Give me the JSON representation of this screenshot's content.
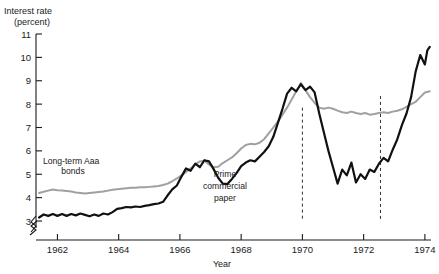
{
  "chart_data": {
    "type": "line",
    "title": "",
    "ylabel": "Interest rate (percent)",
    "ylabel_line1": "Interest rate",
    "ylabel_line2": "(percent)",
    "xlabel": "Year",
    "xlim": [
      1961.3,
      1974.2
    ],
    "ylim": [
      3,
      11
    ],
    "yticks": [
      3,
      4,
      5,
      6,
      7,
      8,
      9,
      10,
      11
    ],
    "ytick_labels": [
      "3",
      "4",
      "5",
      "6",
      "7",
      "8",
      "9",
      "10",
      "11"
    ],
    "xticks": [
      1962,
      1964,
      1966,
      1968,
      1970,
      1972,
      1974
    ],
    "xtick_labels": [
      "1962",
      "1964",
      "1966",
      "1968",
      "1970",
      "1972",
      "1974"
    ],
    "grid": false,
    "legend_position": "inline-annotations",
    "axis_break_y": true,
    "axis_break_x": true,
    "annotations": [
      {
        "name": "aaa-label",
        "text_line1": "Long-term Aaa",
        "text_line2": "bonds",
        "x": 1962.8,
        "y": 5.1
      },
      {
        "name": "prime-label",
        "text_line1": "Prime",
        "text_line2": "commercial",
        "text_line3": "paper",
        "x": 1967.5,
        "y": 4.9
      }
    ],
    "event_lines": [
      {
        "name": "event-line-1970",
        "x": 1970.0,
        "y_top": 7.85,
        "y_bottom": 3.0
      },
      {
        "name": "event-line-1972",
        "x": 1972.55,
        "y_top": 8.35,
        "y_bottom": 3.0
      }
    ],
    "series": [
      {
        "name": "Long-term Aaa bonds",
        "color": "#a0a0a0",
        "x": [
          1961.4,
          1961.55,
          1961.7,
          1961.85,
          1962.0,
          1962.15,
          1962.3,
          1962.45,
          1962.6,
          1962.75,
          1962.9,
          1963.05,
          1963.2,
          1963.35,
          1963.5,
          1963.65,
          1963.8,
          1963.95,
          1964.1,
          1964.25,
          1964.4,
          1964.55,
          1964.7,
          1964.85,
          1965.0,
          1965.15,
          1965.3,
          1965.45,
          1965.6,
          1965.75,
          1965.9,
          1966.05,
          1966.2,
          1966.35,
          1966.5,
          1966.65,
          1966.8,
          1966.95,
          1967.1,
          1967.25,
          1967.4,
          1967.55,
          1967.7,
          1967.85,
          1968.0,
          1968.15,
          1968.3,
          1968.45,
          1968.6,
          1968.75,
          1968.9,
          1969.05,
          1969.2,
          1969.35,
          1969.5,
          1969.65,
          1969.8,
          1969.95,
          1970.1,
          1970.25,
          1970.4,
          1970.55,
          1970.7,
          1970.85,
          1971.0,
          1971.15,
          1971.3,
          1971.45,
          1971.6,
          1971.75,
          1971.9,
          1972.05,
          1972.2,
          1972.35,
          1972.5,
          1972.65,
          1972.8,
          1972.95,
          1973.1,
          1973.25,
          1973.4,
          1973.55,
          1973.7,
          1973.85,
          1974.0
        ],
        "y": [
          4.2,
          4.25,
          4.3,
          4.35,
          4.32,
          4.3,
          4.28,
          4.26,
          4.22,
          4.2,
          4.18,
          4.2,
          4.22,
          4.24,
          4.26,
          4.3,
          4.34,
          4.36,
          4.38,
          4.4,
          4.42,
          4.42,
          4.44,
          4.44,
          4.46,
          4.48,
          4.5,
          4.54,
          4.6,
          4.7,
          4.82,
          4.95,
          5.1,
          5.25,
          5.42,
          5.55,
          5.58,
          5.42,
          5.3,
          5.32,
          5.48,
          5.6,
          5.72,
          5.9,
          6.1,
          6.25,
          6.3,
          6.28,
          6.35,
          6.5,
          6.75,
          7.0,
          7.25,
          7.55,
          7.85,
          8.2,
          8.55,
          8.9,
          8.6,
          8.3,
          8.05,
          7.85,
          7.8,
          7.85,
          7.8,
          7.72,
          7.65,
          7.62,
          7.68,
          7.62,
          7.58,
          7.62,
          7.55,
          7.58,
          7.62,
          7.65,
          7.62,
          7.68,
          7.72,
          7.78,
          7.88,
          8.0,
          8.1,
          8.3,
          8.5
        ]
      },
      {
        "name": "Prime commercial paper",
        "color": "#111111",
        "x": [
          1961.4,
          1961.55,
          1961.7,
          1961.85,
          1962.0,
          1962.15,
          1962.3,
          1962.45,
          1962.6,
          1962.75,
          1962.9,
          1963.05,
          1963.2,
          1963.35,
          1963.5,
          1963.65,
          1963.8,
          1963.95,
          1964.1,
          1964.25,
          1964.4,
          1964.55,
          1964.7,
          1964.85,
          1965.0,
          1965.15,
          1965.3,
          1965.45,
          1965.6,
          1965.75,
          1965.9,
          1966.05,
          1966.2,
          1966.35,
          1966.5,
          1966.65,
          1966.8,
          1966.95,
          1967.1,
          1967.25,
          1967.4,
          1967.55,
          1967.7,
          1967.85,
          1968.0,
          1968.15,
          1968.3,
          1968.45,
          1968.6,
          1968.75,
          1968.9,
          1969.05,
          1969.2,
          1969.35,
          1969.5,
          1969.65,
          1969.8,
          1969.95,
          1970.1,
          1970.25,
          1970.4,
          1970.55,
          1970.7,
          1970.85,
          1971.0,
          1971.15,
          1971.3,
          1971.45,
          1971.6,
          1971.75,
          1971.9,
          1972.05,
          1972.2,
          1972.35,
          1972.5,
          1972.65,
          1972.8,
          1972.95,
          1973.1,
          1973.25,
          1973.4,
          1973.55,
          1973.7,
          1973.85,
          1974.0
        ],
        "y": [
          3.15,
          3.28,
          3.22,
          3.3,
          3.22,
          3.3,
          3.22,
          3.3,
          3.24,
          3.32,
          3.26,
          3.2,
          3.28,
          3.22,
          3.32,
          3.28,
          3.38,
          3.52,
          3.55,
          3.6,
          3.58,
          3.62,
          3.6,
          3.65,
          3.68,
          3.72,
          3.75,
          3.82,
          4.1,
          4.35,
          4.52,
          4.9,
          5.25,
          5.15,
          5.45,
          5.3,
          5.6,
          5.55,
          5.22,
          4.85,
          4.6,
          4.58,
          4.8,
          5.05,
          5.35,
          5.5,
          5.6,
          5.55,
          5.75,
          5.95,
          6.2,
          6.6,
          7.2,
          7.8,
          8.45,
          8.7,
          8.55,
          8.85,
          8.6,
          8.75,
          8.5,
          7.6,
          6.8,
          6.0,
          5.3,
          4.6,
          5.2,
          4.95,
          5.5,
          4.65,
          5.0,
          4.8,
          5.2,
          5.1,
          5.45,
          5.7,
          5.55,
          6.05,
          6.5,
          7.1,
          7.6,
          8.3,
          9.4,
          10.1,
          9.7
        ]
      }
    ],
    "series_tail": [
      {
        "name": "Prime commercial paper tail",
        "x": [
          1974.0,
          1974.08,
          1974.16
        ],
        "y": [
          9.7,
          10.3,
          10.45
        ]
      },
      {
        "name": "Long-term Aaa bonds tail",
        "x": [
          1974.0,
          1974.16
        ],
        "y": [
          8.5,
          8.55
        ]
      }
    ]
  },
  "axis": {
    "y_title_line1": "Interest rate",
    "y_title_line2": "(percent)",
    "x_title": "Year"
  }
}
